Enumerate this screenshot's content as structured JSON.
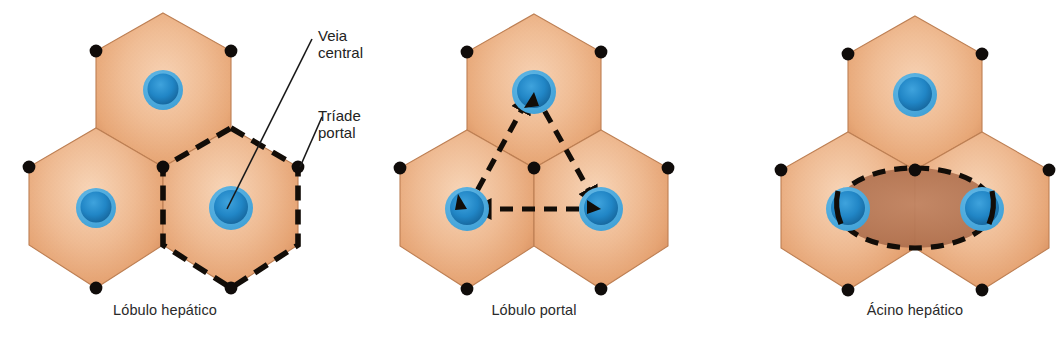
{
  "figure": {
    "background": "#ffffff"
  },
  "colors": {
    "hexagon_fill_light": "#f3c4a2",
    "hexagon_fill_mid": "#e8a878",
    "hexagon_fill_dark": "#d98f5e",
    "hexagon_edge": "#c4seven",
    "hexagon_stroke": "#b97a4e",
    "vein_outer": "#57b0e0",
    "vein_inner": "#1f7fc0",
    "vein_core": "#17689f",
    "triad_dot": "#100c0a",
    "dashed_line": "#120d08",
    "acinus_fill": "#b0714f",
    "leader_line": "#1a1a1a",
    "text": "#232323"
  },
  "annotations": [
    {
      "id": "veia-central",
      "line1": "Veia",
      "line2": "central"
    },
    {
      "id": "triade-portal",
      "line1": "Tríade",
      "line2": "portal"
    }
  ],
  "panels": [
    {
      "id": "lobulo-hepatico",
      "caption": "Lóbulo hepático",
      "highlight": "dashed-hexagon",
      "highlight_description": "Dashed hexagon outlining the lower-right lobule",
      "hexagons": [
        {
          "position": "top",
          "has_central_vein": true
        },
        {
          "position": "lower-left",
          "has_central_vein": true
        },
        {
          "position": "lower-right",
          "has_central_vein": true
        }
      ],
      "portal_triad_count": 6
    },
    {
      "id": "lobulo-portal",
      "caption": "Lóbulo portal",
      "highlight": "dashed-triangle",
      "highlight_description": "Dashed triangle connecting the three central veins with arrowheads pointing toward each vein",
      "hexagons": [
        {
          "position": "top",
          "has_central_vein": true
        },
        {
          "position": "lower-left",
          "has_central_vein": true
        },
        {
          "position": "lower-right",
          "has_central_vein": true
        }
      ],
      "portal_triad_count": 7
    },
    {
      "id": "acino-hepatico",
      "caption": "Ácino hepático",
      "highlight": "dashed-ellipse",
      "highlight_description": "Dashed ellipse spanning the two lower central veins with shaded brown fill",
      "hexagons": [
        {
          "position": "top",
          "has_central_vein": true
        },
        {
          "position": "lower-left",
          "has_central_vein": true
        },
        {
          "position": "lower-right",
          "has_central_vein": true
        }
      ],
      "portal_triad_count": 7
    }
  ],
  "captions": {
    "left": "Lóbulo hepático",
    "middle": "Lóbulo portal",
    "right": "Ácino hepático"
  }
}
